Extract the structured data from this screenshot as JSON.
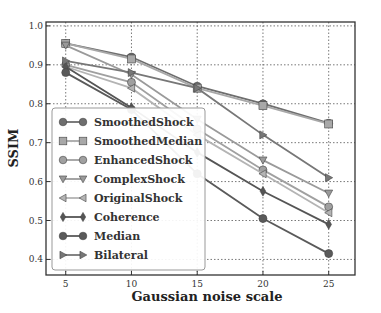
{
  "chart_data": {
    "type": "line",
    "title": "",
    "xlabel": "Gaussian noise scale",
    "ylabel": "SSIM",
    "x": [
      5,
      10,
      15,
      20,
      25
    ],
    "xticks": [
      "5",
      "10",
      "15",
      "20",
      "25"
    ],
    "yticks": [
      "0.4",
      "0.5",
      "0.6",
      "0.7",
      "0.8",
      "0.9",
      "1.0"
    ],
    "xlim": [
      3.5,
      27
    ],
    "ylim": [
      0.36,
      1.01
    ],
    "grid": true,
    "legend_position": "lower left",
    "series": [
      {
        "name": "SmoothedShock",
        "marker": "circle",
        "color": "#6e6e6e",
        "values": [
          0.955,
          0.92,
          0.845,
          0.8,
          0.75
        ]
      },
      {
        "name": "SmoothedMedian",
        "marker": "square",
        "color": "#a8a8a8",
        "values": [
          0.955,
          0.915,
          0.84,
          0.795,
          0.748
        ]
      },
      {
        "name": "EnhancedShock",
        "marker": "circle",
        "color": "#a0a0a0",
        "values": [
          0.9,
          0.855,
          0.735,
          0.63,
          0.535
        ]
      },
      {
        "name": "ComplexShock",
        "marker": "triangle-down",
        "color": "#9a9a9a",
        "values": [
          0.95,
          0.875,
          0.76,
          0.655,
          0.57
        ]
      },
      {
        "name": "OriginalShock",
        "marker": "triangle-left",
        "color": "#b4b4b4",
        "values": [
          0.895,
          0.84,
          0.72,
          0.62,
          0.52
        ]
      },
      {
        "name": "Coherence",
        "marker": "diamond",
        "color": "#555555",
        "values": [
          0.895,
          0.79,
          0.675,
          0.575,
          0.49
        ]
      },
      {
        "name": "Median",
        "marker": "circle",
        "color": "#5a5a5a",
        "values": [
          0.88,
          0.785,
          0.62,
          0.505,
          0.415
        ]
      },
      {
        "name": "Bilateral",
        "marker": "triangle-right",
        "color": "#777777",
        "values": [
          0.91,
          0.88,
          0.84,
          0.72,
          0.61
        ]
      }
    ]
  }
}
